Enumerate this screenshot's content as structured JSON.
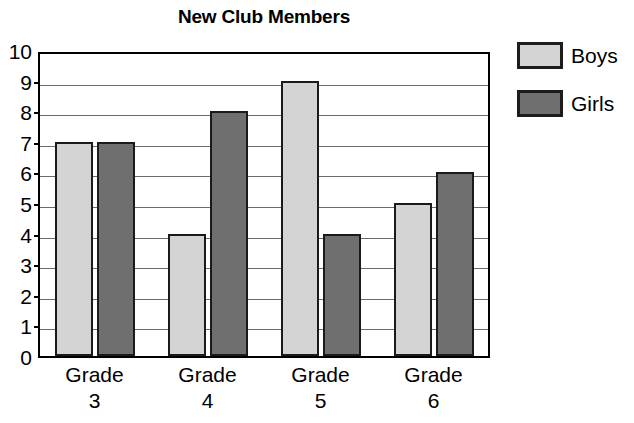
{
  "chart_data": {
    "type": "bar",
    "title": "New Club Members",
    "xlabel": "",
    "ylabel": "",
    "categories": [
      "Grade 3",
      "Grade 4",
      "Grade 5",
      "Grade 6"
    ],
    "category_lines": [
      {
        "line1": "Grade",
        "line2": "3"
      },
      {
        "line1": "Grade",
        "line2": "4"
      },
      {
        "line1": "Grade",
        "line2": "5"
      },
      {
        "line1": "Grade",
        "line2": "6"
      }
    ],
    "series": [
      {
        "name": "Boys",
        "values": [
          7,
          4,
          9,
          5
        ],
        "color": "#d4d4d4"
      },
      {
        "name": "Girls",
        "values": [
          7,
          8,
          4,
          6
        ],
        "color": "#6f6f6f"
      }
    ],
    "ylim": [
      0,
      10
    ],
    "y_ticks": [
      0,
      1,
      2,
      3,
      4,
      5,
      6,
      7,
      8,
      9,
      10
    ],
    "y_tick_labels": [
      "0",
      "1",
      "2",
      "3",
      "4",
      "5",
      "6",
      "7",
      "8",
      "9",
      "10"
    ],
    "grid": {
      "horizontal": true,
      "vertical": false,
      "color": "#6a6a6a"
    },
    "legend": {
      "position": "right",
      "entries": [
        {
          "label": "Boys",
          "color": "#d4d4d4"
        },
        {
          "label": "Girls",
          "color": "#6f6f6f"
        }
      ]
    },
    "bar_border_color": "#1a1a1a",
    "plot_border_color": "#000000",
    "background_color": "#ffffff"
  }
}
